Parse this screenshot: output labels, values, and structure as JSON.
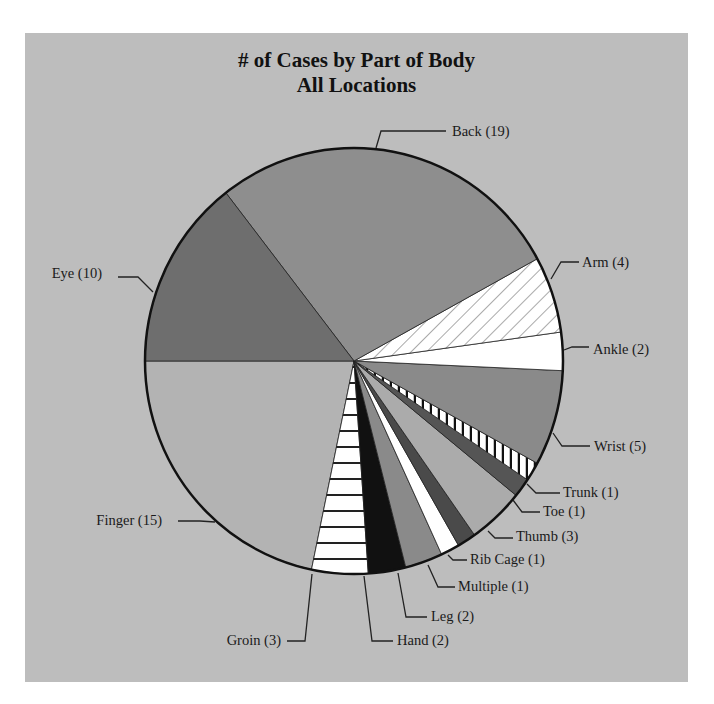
{
  "chart_data": {
    "type": "pie",
    "title": "# of Cases by Part of Body",
    "subtitle": "All Locations",
    "total": 69,
    "start_angle_deg": 180,
    "direction": "counterclockwise-on-screen",
    "slices": [
      {
        "label": "Finger",
        "value": 15,
        "fill": "#b3b3b3",
        "pattern": "none"
      },
      {
        "label": "Groin",
        "value": 3,
        "fill": "#ffffff",
        "pattern": "horizontal"
      },
      {
        "label": "Hand",
        "value": 2,
        "fill": "#111111",
        "pattern": "none"
      },
      {
        "label": "Leg",
        "value": 2,
        "fill": "#8a8a8a",
        "pattern": "none"
      },
      {
        "label": "Multiple",
        "value": 1,
        "fill": "#ffffff",
        "pattern": "none"
      },
      {
        "label": "Rib Cage",
        "value": 1,
        "fill": "#4a4a4a",
        "pattern": "none"
      },
      {
        "label": "Thumb",
        "value": 3,
        "fill": "#ababab",
        "pattern": "none"
      },
      {
        "label": "Toe",
        "value": 1,
        "fill": "#555555",
        "pattern": "none"
      },
      {
        "label": "Trunk",
        "value": 1,
        "fill": "#ffffff",
        "pattern": "vertical"
      },
      {
        "label": "Wrist",
        "value": 5,
        "fill": "#8a8a8a",
        "pattern": "none"
      },
      {
        "label": "Ankle",
        "value": 2,
        "fill": "#ffffff",
        "pattern": "none"
      },
      {
        "label": "Arm",
        "value": 4,
        "fill": "#ffffff",
        "pattern": "diagonal"
      },
      {
        "label": "Back",
        "value": 19,
        "fill": "#8e8e8e",
        "pattern": "none"
      },
      {
        "label": "Eye",
        "value": 10,
        "fill": "#6e6e6e",
        "pattern": "none"
      }
    ],
    "labels": [
      {
        "text": "Back (19)",
        "x": 452,
        "y": 136,
        "anchor": "start",
        "line": [
          [
            376,
            148
          ],
          [
            381,
            131
          ],
          [
            446,
            131
          ]
        ]
      },
      {
        "text": "Arm (4)",
        "x": 582,
        "y": 267,
        "anchor": "start",
        "line": [
          [
            551,
            279
          ],
          [
            561,
            262
          ],
          [
            579,
            262
          ]
        ]
      },
      {
        "text": "Ankle (2)",
        "x": 593,
        "y": 354,
        "anchor": "start",
        "line": [
          [
            564,
            350
          ],
          [
            572,
            347
          ],
          [
            589,
            347
          ]
        ]
      },
      {
        "text": "Wrist (5)",
        "x": 594,
        "y": 451,
        "anchor": "start",
        "line": [
          [
            553,
            433
          ],
          [
            562,
            446
          ],
          [
            590,
            446
          ]
        ]
      },
      {
        "text": "Trunk (1)",
        "x": 563,
        "y": 497,
        "anchor": "start",
        "line": [
          [
            527,
            484
          ],
          [
            536,
            493
          ],
          [
            560,
            493
          ]
        ]
      },
      {
        "text": "Toe (1)",
        "x": 543,
        "y": 516,
        "anchor": "start",
        "line": [
          [
            513,
            500
          ],
          [
            522,
            512
          ],
          [
            540,
            512
          ]
        ]
      },
      {
        "text": "Thumb (3)",
        "x": 516,
        "y": 541,
        "anchor": "start",
        "line": [
          [
            488,
            531
          ],
          [
            495,
            538
          ],
          [
            513,
            538
          ]
        ]
      },
      {
        "text": "Rib Cage (1)",
        "x": 470,
        "y": 564,
        "anchor": "start",
        "line": [
          [
            448,
            555
          ],
          [
            453,
            560
          ],
          [
            467,
            560
          ]
        ]
      },
      {
        "text": "Multiple (1)",
        "x": 458,
        "y": 591,
        "anchor": "start",
        "line": [
          [
            428,
            565
          ],
          [
            438,
            587
          ],
          [
            455,
            587
          ]
        ]
      },
      {
        "text": "Leg (2)",
        "x": 431,
        "y": 621,
        "anchor": "start",
        "line": [
          [
            398,
            573
          ],
          [
            406,
            617
          ],
          [
            427,
            617
          ]
        ]
      },
      {
        "text": "Hand (2)",
        "x": 397,
        "y": 645,
        "anchor": "start",
        "line": [
          [
            364,
            576
          ],
          [
            372,
            641
          ],
          [
            393,
            641
          ]
        ]
      },
      {
        "text": "Groin (3)",
        "x": 281,
        "y": 645,
        "anchor": "end",
        "line": [
          [
            312,
            574
          ],
          [
            305,
            641
          ],
          [
            287,
            641
          ]
        ]
      },
      {
        "text": "Finger (15)",
        "x": 162,
        "y": 525,
        "anchor": "end",
        "line": [
          [
            215,
            522
          ],
          [
            200,
            521
          ],
          [
            178,
            521
          ]
        ]
      },
      {
        "text": "Eye (10)",
        "x": 102,
        "y": 278,
        "anchor": "end",
        "line": [
          [
            153,
            292
          ],
          [
            138,
            277
          ],
          [
            118,
            277
          ]
        ]
      }
    ],
    "geometry": {
      "cx": 354,
      "cy": 361,
      "rx": 209,
      "ry": 213
    }
  }
}
